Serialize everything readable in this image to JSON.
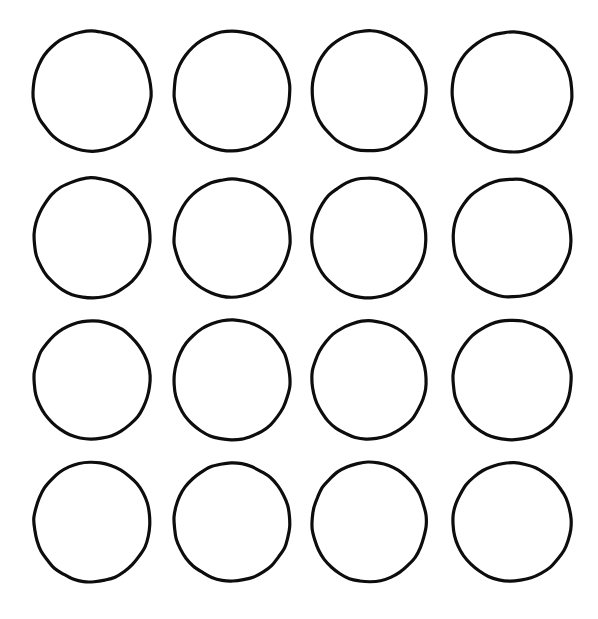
{
  "page": {
    "background_color": "#ffffff",
    "width": 598,
    "height": 619
  },
  "drawing": {
    "name": "blank-circle-grid",
    "description": "Four by four grid of hand-drawn blank circles",
    "stroke_color": "#0d0d0d",
    "fill_color": "#ffffff",
    "stroke_width": 3.2,
    "rows": 4,
    "columns": 4,
    "total_circles": 16,
    "circle_diameter": 119
  },
  "circles": [
    {
      "id": "circle-r1-c1",
      "row": 1,
      "column": 1,
      "cx": 92,
      "cy": 91,
      "rx": 59,
      "ry": 60,
      "rotation": -6
    },
    {
      "id": "circle-r1-c2",
      "row": 1,
      "column": 2,
      "cx": 232,
      "cy": 91,
      "rx": 58,
      "ry": 60,
      "rotation": 5
    },
    {
      "id": "circle-r1-c3",
      "row": 1,
      "column": 3,
      "cx": 369,
      "cy": 91,
      "rx": 57,
      "ry": 60,
      "rotation": -3
    },
    {
      "id": "circle-r1-c4",
      "row": 1,
      "column": 4,
      "cx": 512,
      "cy": 92,
      "rx": 60,
      "ry": 60,
      "rotation": 7
    },
    {
      "id": "circle-r2-c1",
      "row": 2,
      "column": 1,
      "cx": 92,
      "cy": 238,
      "rx": 58,
      "ry": 60,
      "rotation": 4
    },
    {
      "id": "circle-r2-c2",
      "row": 2,
      "column": 2,
      "cx": 232,
      "cy": 238,
      "rx": 58,
      "ry": 59,
      "rotation": -5
    },
    {
      "id": "circle-r2-c3",
      "row": 2,
      "column": 3,
      "cx": 369,
      "cy": 238,
      "rx": 57,
      "ry": 60,
      "rotation": 3
    },
    {
      "id": "circle-r2-c4",
      "row": 2,
      "column": 4,
      "cx": 512,
      "cy": 238,
      "rx": 59,
      "ry": 59,
      "rotation": -7
    },
    {
      "id": "circle-r3-c1",
      "row": 3,
      "column": 1,
      "cx": 92,
      "cy": 380,
      "rx": 58,
      "ry": 59,
      "rotation": -4
    },
    {
      "id": "circle-r3-c2",
      "row": 3,
      "column": 2,
      "cx": 232,
      "cy": 380,
      "rx": 58,
      "ry": 60,
      "rotation": 6
    },
    {
      "id": "circle-r3-c3",
      "row": 3,
      "column": 3,
      "cx": 369,
      "cy": 380,
      "rx": 57,
      "ry": 59,
      "rotation": -2
    },
    {
      "id": "circle-r3-c4",
      "row": 3,
      "column": 4,
      "cx": 512,
      "cy": 380,
      "rx": 59,
      "ry": 60,
      "rotation": 5
    },
    {
      "id": "circle-r4-c1",
      "row": 4,
      "column": 1,
      "cx": 92,
      "cy": 522,
      "rx": 58,
      "ry": 60,
      "rotation": 3
    },
    {
      "id": "circle-r4-c2",
      "row": 4,
      "column": 2,
      "cx": 232,
      "cy": 522,
      "rx": 58,
      "ry": 59,
      "rotation": -6
    },
    {
      "id": "circle-r4-c3",
      "row": 4,
      "column": 3,
      "cx": 369,
      "cy": 522,
      "rx": 57,
      "ry": 60,
      "rotation": 4
    },
    {
      "id": "circle-r4-c4",
      "row": 4,
      "column": 4,
      "cx": 512,
      "cy": 522,
      "rx": 59,
      "ry": 59,
      "rotation": -3
    }
  ]
}
